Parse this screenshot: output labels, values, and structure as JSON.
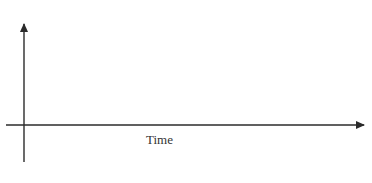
{
  "diagram": {
    "type": "empty-axes",
    "x_axis": {
      "label": "Time",
      "arrow": true
    },
    "y_axis": {
      "label": "",
      "arrow": true
    },
    "colors": {
      "axis": "#2b2b2b",
      "label": "#333333",
      "background": "#ffffff"
    }
  }
}
